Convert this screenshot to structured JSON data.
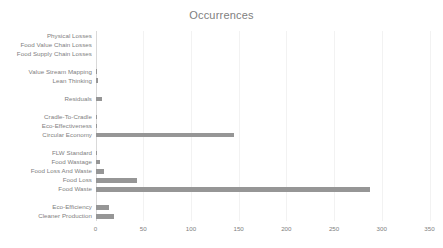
{
  "chart": {
    "title": "Occurrences",
    "accent_color": "#969696",
    "text_color": "#808080",
    "grid_color": "#f2f2f2",
    "axis_color": "#d9d9d9"
  },
  "chart_data": {
    "type": "bar",
    "orientation": "horizontal",
    "title": "Occurrences",
    "xlabel": "",
    "ylabel": "",
    "xlim": [
      0,
      350
    ],
    "ylim": null,
    "grid": true,
    "legend": false,
    "xticks": [
      0,
      50,
      100,
      150,
      200,
      250,
      300,
      350
    ],
    "categories": [
      "Physical Losses",
      "Food Value Chain Losses",
      "Food Supply Chain Losses",
      "",
      "Value Stream Mapping",
      "Lean Thinking",
      "",
      "Residuals",
      "",
      "Cradle-To-Cradle",
      "Eco-Effectiveness",
      "Circular Economy",
      "",
      "FLW Standard",
      "Food Wastage",
      "Food Loss And Waste",
      "Food Loss",
      "Food Waste",
      "",
      "Eco-Efficiency",
      "Cleaner Production"
    ],
    "values": [
      0,
      0,
      0,
      null,
      2,
      3,
      null,
      7,
      null,
      1,
      1,
      145,
      null,
      1,
      5,
      9,
      44,
      288,
      null,
      14,
      19
    ]
  }
}
